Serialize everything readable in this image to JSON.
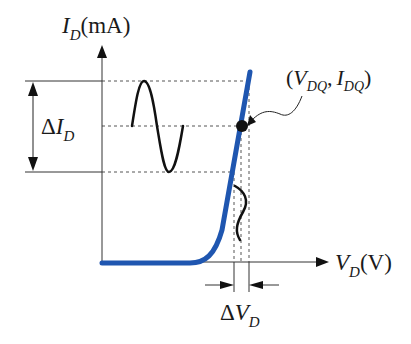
{
  "diagram": {
    "y_axis": {
      "symbol": "I",
      "subscript": "D",
      "unit": "(mA)"
    },
    "x_axis": {
      "symbol": "V",
      "subscript": "D",
      "unit": "(V)"
    },
    "delta_current": {
      "prefix": "Δ",
      "symbol": "I",
      "subscript": "D"
    },
    "delta_voltage": {
      "prefix": "Δ",
      "symbol": "V",
      "subscript": "D"
    },
    "q_point": {
      "open": "(",
      "v_symbol": "V",
      "v_subscript": "DQ",
      "separator": ",",
      "i_symbol": "I",
      "i_subscript": "DQ",
      "close": ")"
    },
    "colors": {
      "curve": "#1f56b0",
      "axes": "#333333",
      "signal": "#111111",
      "guides": "#555555"
    }
  }
}
